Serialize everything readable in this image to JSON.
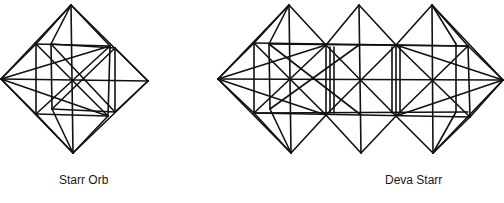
{
  "figures": [
    {
      "label": "Starr Orb",
      "lines": [
        [
          71,
          5,
          1,
          79
        ],
        [
          71,
          5,
          148,
          81
        ],
        [
          1,
          79,
          73,
          153
        ],
        [
          148,
          81,
          73,
          153
        ],
        [
          71,
          5,
          73,
          153
        ],
        [
          1,
          79,
          148,
          81
        ],
        [
          36,
          44,
          110,
          46
        ],
        [
          51,
          44,
          115,
          48
        ],
        [
          36,
          114,
          108,
          116
        ],
        [
          52,
          109,
          115,
          112
        ],
        [
          36,
          44,
          36,
          114
        ],
        [
          51,
          44,
          52,
          109
        ],
        [
          110,
          46,
          108,
          116
        ],
        [
          115,
          48,
          115,
          112
        ],
        [
          71,
          5,
          36,
          44
        ],
        [
          71,
          5,
          51,
          44
        ],
        [
          71,
          5,
          110,
          46
        ],
        [
          1,
          79,
          36,
          44
        ],
        [
          1,
          79,
          110,
          46
        ],
        [
          1,
          79,
          36,
          114
        ],
        [
          1,
          79,
          108,
          116
        ],
        [
          148,
          81,
          115,
          48
        ],
        [
          148,
          81,
          115,
          112
        ],
        [
          73,
          153,
          36,
          114
        ],
        [
          73,
          153,
          52,
          109
        ],
        [
          73,
          153,
          108,
          116
        ],
        [
          36,
          44,
          108,
          116
        ],
        [
          36,
          114,
          110,
          46
        ],
        [
          51,
          44,
          115,
          112
        ],
        [
          52,
          109,
          115,
          48
        ]
      ]
    },
    {
      "label": "Deva Starr",
      "lines": [
        [
          289,
          5,
          218,
          79
        ],
        [
          289,
          5,
          326,
          45
        ],
        [
          218,
          79,
          291,
          153
        ],
        [
          291,
          153,
          326,
          115
        ],
        [
          359,
          5,
          326,
          45
        ],
        [
          359,
          5,
          396,
          45
        ],
        [
          361,
          153,
          326,
          115
        ],
        [
          361,
          153,
          396,
          116
        ],
        [
          432,
          5,
          396,
          45
        ],
        [
          432,
          5,
          503,
          80
        ],
        [
          433,
          153,
          396,
          116
        ],
        [
          503,
          80,
          433,
          153
        ],
        [
          289,
          5,
          291,
          153
        ],
        [
          359,
          5,
          361,
          153
        ],
        [
          432,
          5,
          433,
          153
        ],
        [
          218,
          79,
          503,
          80
        ],
        [
          254,
          43,
          468,
          46
        ],
        [
          269,
          44,
          468,
          46
        ],
        [
          254,
          113,
          468,
          112
        ],
        [
          254,
          113,
          470,
          117
        ],
        [
          254,
          43,
          254,
          113
        ],
        [
          269,
          44,
          270,
          109
        ],
        [
          326,
          45,
          326,
          115
        ],
        [
          330,
          47,
          330,
          113
        ],
        [
          334,
          47,
          334,
          113
        ],
        [
          392,
          47,
          392,
          113
        ],
        [
          396,
          45,
          396,
          116
        ],
        [
          400,
          47,
          400,
          113
        ],
        [
          468,
          46,
          470,
          117
        ],
        [
          456,
          44,
          456,
          112
        ],
        [
          289,
          5,
          254,
          43
        ],
        [
          289,
          5,
          269,
          44
        ],
        [
          218,
          79,
          254,
          43
        ],
        [
          218,
          79,
          326,
          45
        ],
        [
          218,
          79,
          254,
          113
        ],
        [
          218,
          79,
          326,
          115
        ],
        [
          291,
          153,
          254,
          113
        ],
        [
          291,
          153,
          270,
          109
        ],
        [
          254,
          43,
          326,
          115
        ],
        [
          254,
          113,
          326,
          45
        ],
        [
          269,
          44,
          361,
          115
        ],
        [
          270,
          109,
          359,
          45
        ],
        [
          326,
          45,
          396,
          116
        ],
        [
          326,
          115,
          396,
          45
        ],
        [
          396,
          45,
          470,
          117
        ],
        [
          396,
          116,
          468,
          46
        ],
        [
          432,
          5,
          456,
          44
        ],
        [
          432,
          5,
          468,
          46
        ],
        [
          503,
          80,
          468,
          46
        ],
        [
          503,
          80,
          396,
          45
        ],
        [
          503,
          80,
          470,
          117
        ],
        [
          503,
          80,
          396,
          116
        ],
        [
          433,
          153,
          470,
          117
        ],
        [
          433,
          153,
          456,
          112
        ]
      ]
    }
  ],
  "style": {
    "stroke": "#111111",
    "stroke_width": 1.6,
    "background": "#ffffff"
  }
}
